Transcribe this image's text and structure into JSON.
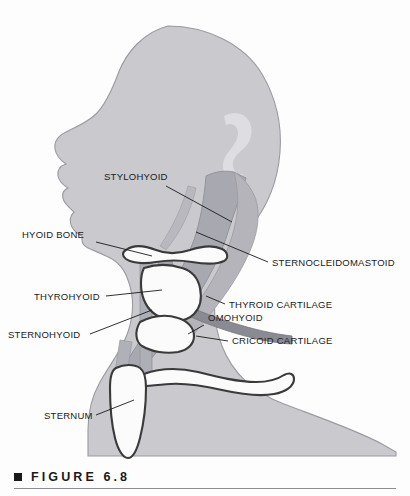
{
  "figure": {
    "caption_number": "FIGURE 6.8",
    "bullet_icon": "filled-square-icon"
  },
  "colors": {
    "background": "#fdfdfd",
    "silhouette": "#c9c9ce",
    "silhouette_outline": "#9a9aa2",
    "muscle_mid": "#b2b2b8",
    "muscle_dark": "#9b9ba3",
    "muscle_darkest": "#8a8a92",
    "bone_fill": "#fbfbfb",
    "bone_outline": "#3a3a3a",
    "ear_highlight": "#dedee2",
    "label_text": "#1b1b1b",
    "leader_line": "#1b1b1b",
    "caption_rule": "#8d8d93"
  },
  "labels": [
    {
      "id": "stylohyoid",
      "text": "STYLOHYOID",
      "text_x": 104,
      "text_y": 180,
      "anchor": "start",
      "leader": [
        [
          166,
          186
        ],
        [
          232,
          222
        ]
      ]
    },
    {
      "id": "hyoid-bone",
      "text": "HYOID BONE",
      "text_x": 22,
      "text_y": 238,
      "anchor": "start",
      "leader": [
        [
          96,
          242
        ],
        [
          152,
          256
        ]
      ]
    },
    {
      "id": "thyrohyoid",
      "text": "THYROHYOID",
      "text_x": 34,
      "text_y": 300,
      "anchor": "start",
      "leader": [
        [
          106,
          296
        ],
        [
          162,
          290
        ]
      ]
    },
    {
      "id": "sternohyoid",
      "text": "STERNOHYOID",
      "text_x": 8,
      "text_y": 338,
      "anchor": "start",
      "leader": [
        [
          90,
          334
        ],
        [
          152,
          310
        ]
      ]
    },
    {
      "id": "sternum",
      "text": "STERNUM",
      "text_x": 44,
      "text_y": 419,
      "anchor": "start",
      "leader": [
        [
          96,
          415
        ],
        [
          134,
          400
        ]
      ]
    },
    {
      "id": "sternocleidomastoid",
      "text": "STERNOCLEIDOMASTOID",
      "text_x": 272,
      "text_y": 266,
      "anchor": "start",
      "leader": [
        [
          268,
          262
        ],
        [
          196,
          232
        ]
      ]
    },
    {
      "id": "thyroid-cartilage",
      "text": "THYROID CARTILAGE",
      "text_x": 229,
      "text_y": 308,
      "anchor": "start",
      "leader": [
        [
          225,
          304
        ],
        [
          206,
          296
        ]
      ]
    },
    {
      "id": "omohyoid",
      "text": "OMOHYOID",
      "text_x": 208,
      "text_y": 321,
      "anchor": "start",
      "leader": [
        [
          204,
          325
        ],
        [
          188,
          334
        ]
      ]
    },
    {
      "id": "cricoid-cartilage",
      "text": "CRICOID CARTILAGE",
      "text_x": 232,
      "text_y": 344,
      "anchor": "start",
      "leader": [
        [
          228,
          341
        ],
        [
          196,
          336
        ]
      ]
    }
  ]
}
